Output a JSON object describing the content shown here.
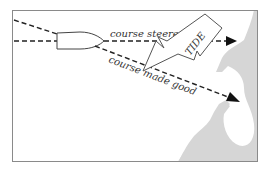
{
  "diagram": {
    "labels": {
      "course_steered": "course steered",
      "course_made_good": "course made good",
      "tide": "TIDE"
    },
    "colors": {
      "background": "#ffffff",
      "frame": "#8a8a8a",
      "line": "#222222",
      "land": "#d6d6d6",
      "boat_fill": "#ffffff",
      "arrow_outline": "#555555"
    }
  }
}
